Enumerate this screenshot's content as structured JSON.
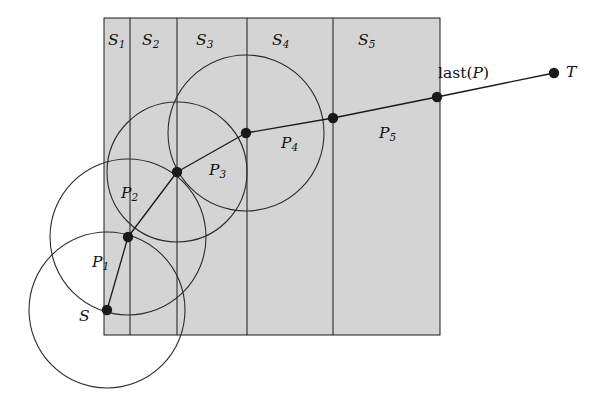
{
  "figure": {
    "type": "geometric-diagram",
    "colors": {
      "slab_fill": "#d4d4d4",
      "stroke": "#1a1a1a",
      "background": "#ffffff",
      "circle_stroke": "#2b2b2b"
    },
    "region": {
      "x": 104,
      "y": 18,
      "width": 336,
      "height": 317,
      "divider_x": [
        130,
        177,
        247,
        333
      ]
    },
    "slab_labels": [
      {
        "id": "S1",
        "base": "S",
        "sub": "1",
        "x": 108,
        "y": 33
      },
      {
        "id": "S2",
        "base": "S",
        "sub": "2",
        "x": 142,
        "y": 33
      },
      {
        "id": "S3",
        "base": "S",
        "sub": "3",
        "x": 196,
        "y": 33
      },
      {
        "id": "S4",
        "base": "S",
        "sub": "4",
        "x": 272,
        "y": 33
      },
      {
        "id": "S5",
        "base": "S",
        "sub": "5",
        "x": 358,
        "y": 33
      }
    ],
    "path_vertices": [
      {
        "id": "S",
        "x": 107,
        "y": 310,
        "dot": true
      },
      {
        "id": "v1",
        "x": 128,
        "y": 237,
        "dot": true
      },
      {
        "id": "v2",
        "x": 177,
        "y": 172,
        "dot": true
      },
      {
        "id": "v3",
        "x": 246,
        "y": 133,
        "dot": true
      },
      {
        "id": "v4",
        "x": 333,
        "y": 118,
        "dot": true
      },
      {
        "id": "v5",
        "x": 437,
        "y": 97,
        "dot": true
      },
      {
        "id": "T",
        "x": 554,
        "y": 73,
        "dot": true
      }
    ],
    "circles": [
      {
        "id": "circle-at-S",
        "cx": 107,
        "cy": 310,
        "r": 78
      },
      {
        "id": "circle-at-v1",
        "cx": 128,
        "cy": 237,
        "r": 78
      },
      {
        "id": "circle-at-v2",
        "cx": 177,
        "cy": 172,
        "r": 70
      },
      {
        "id": "circle-at-v3",
        "cx": 246,
        "cy": 133,
        "r": 78
      }
    ],
    "segment_labels": [
      {
        "id": "P1",
        "base": "P",
        "sub": "1",
        "x": 92,
        "y": 255
      },
      {
        "id": "P2",
        "base": "P",
        "sub": "2",
        "x": 121,
        "y": 186
      },
      {
        "id": "P3",
        "base": "P",
        "sub": "3",
        "x": 209,
        "y": 163
      },
      {
        "id": "P4",
        "base": "P",
        "sub": "4",
        "x": 281,
        "y": 136
      },
      {
        "id": "P5",
        "base": "P",
        "sub": "5",
        "x": 379,
        "y": 126
      }
    ],
    "point_labels": [
      {
        "id": "S-label",
        "text": "S",
        "x": 79,
        "y": 309
      },
      {
        "id": "T-label",
        "text": "T",
        "x": 566,
        "y": 65
      }
    ],
    "function_label": {
      "id": "last-of-P",
      "prefix": "last(",
      "arg": "P",
      "suffix": ")",
      "x": 438,
      "y": 66
    }
  }
}
